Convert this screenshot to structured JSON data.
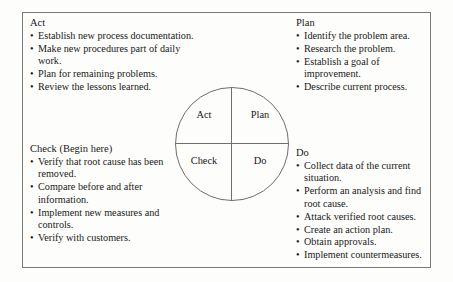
{
  "diagram": {
    "bullet_glyph": "•",
    "quadrants": [
      {
        "label": "Act"
      },
      {
        "label": "Plan"
      },
      {
        "label": "Check"
      },
      {
        "label": "Do"
      }
    ]
  },
  "blocks": {
    "act": {
      "title": "Act",
      "items": [
        "Establish new process documentation.",
        "Make new procedures part of daily work.",
        "Plan for remaining problems.",
        "Review the lessons learned."
      ]
    },
    "plan": {
      "title": "Plan",
      "items": [
        "Identify the problem area.",
        "Research the problem.",
        "Establish a goal of improvement.",
        "Describe current process."
      ]
    },
    "check": {
      "title": "Check (Begin here)",
      "items": [
        "Verify that root cause has been removed.",
        "Compare before and after information.",
        "Implement new measures and controls.",
        "Verify with customers."
      ]
    },
    "do": {
      "title": "Do",
      "items": [
        "Collect data of the current situation.",
        "Perform an analysis and find root cause.",
        "Attack verified root causes.",
        "Create an action plan.",
        "Obtain approvals.",
        "Implement countermeasures."
      ]
    }
  }
}
